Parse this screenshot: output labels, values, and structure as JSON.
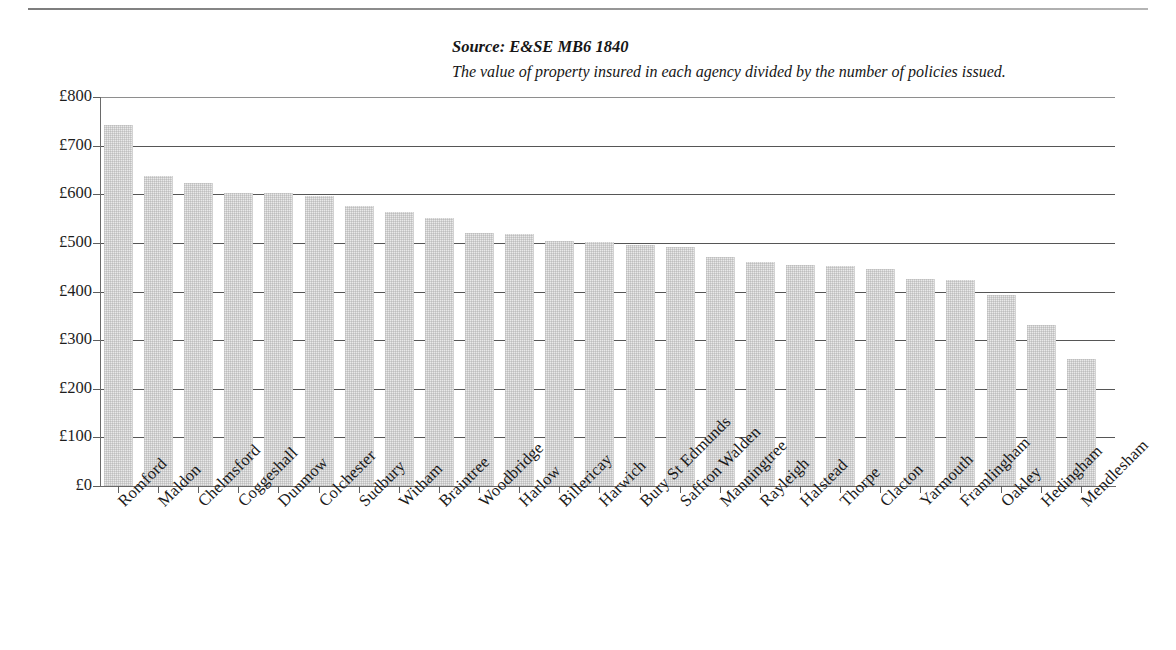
{
  "caption": {
    "source": "Source: E&SE MB6 1840",
    "description": "The value of property insured in each agency divided by the number of policies issued."
  },
  "chart_data": {
    "type": "bar",
    "title": "Source: E&SE MB6 1840",
    "subtitle": "The value of property insured in each agency divided by the number of policies issued.",
    "xlabel": "",
    "ylabel": "",
    "ylim": [
      0,
      800
    ],
    "ytick_step": 100,
    "ytick_labels": [
      "£0",
      "£100",
      "£200",
      "£300",
      "£400",
      "£500",
      "£600",
      "£700",
      "£800"
    ],
    "ytick_values": [
      0,
      100,
      200,
      300,
      400,
      500,
      600,
      700,
      800
    ],
    "currency_symbol": "£",
    "grid": true,
    "legend": false,
    "bar_color": "#e9e9e9",
    "categories": [
      "Romford",
      "Maldon",
      "Chelmsford",
      "Coggeshall",
      "Dunmow",
      "Colchester",
      "Sudbury",
      "Witham",
      "Braintree",
      "Woodbridge",
      "Harlow",
      "Billericay",
      "Harwich",
      "Bury St Edmunds",
      "Saffron Walden",
      "Manningtree",
      "Rayleigh",
      "Halstead",
      "Thorpe",
      "Clacton",
      "Yarmouth",
      "Framlingham",
      "Oakley",
      "Hedingham",
      "Mendlesham"
    ],
    "values": [
      742,
      638,
      623,
      603,
      603,
      596,
      575,
      563,
      552,
      520,
      518,
      504,
      502,
      496,
      491,
      470,
      461,
      455,
      453,
      446,
      425,
      424,
      392,
      331,
      262
    ]
  }
}
